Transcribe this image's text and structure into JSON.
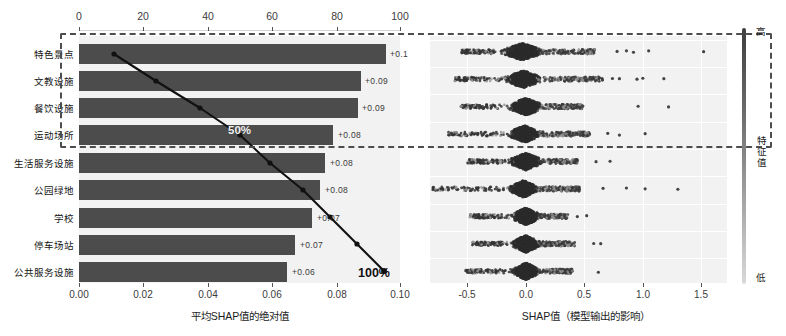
{
  "chart_data": {
    "type": "bar",
    "title": "",
    "subtitle": "",
    "panels": [
      {
        "name": "mean-abs-shap-bar",
        "type": "bar",
        "orientation": "horizontal",
        "categories": [
          "特色景点",
          "文教设施",
          "餐饮设施",
          "运动场所",
          "生活服务设施",
          "公园绿地",
          "学校",
          "停车场站",
          "公共服务设施"
        ],
        "values": [
          0.1,
          0.09,
          0.09,
          0.08,
          0.08,
          0.08,
          0.07,
          0.07,
          0.06
        ],
        "value_labels": [
          "+0.1",
          "+0.09",
          "+0.09",
          "+0.08",
          "+0.08",
          "+0.08",
          "+0.07",
          "+0.07",
          "+0.06"
        ],
        "xlabel": "平均SHAP值的绝对值",
        "ylabel": "",
        "xlim": [
          0.0,
          0.1005
        ],
        "xticks": [
          "0.00",
          "0.02",
          "0.04",
          "0.06",
          "0.08",
          "0.10"
        ],
        "xtick_values": [
          0.0,
          0.02,
          0.04,
          0.06,
          0.08,
          0.1
        ],
        "grid": false,
        "bar_color": "#4c4c4c",
        "plot_bg": "#f2f2f2"
      },
      {
        "name": "cumulative-pareto-line",
        "type": "line",
        "secondary_axis": "top",
        "xticks_top": [
          "0",
          "20",
          "40",
          "60",
          "80",
          "100"
        ],
        "xtick_top_values": [
          0,
          20,
          40,
          60,
          80,
          100
        ],
        "cumulative_percent": [
          11.0,
          24.0,
          37.5,
          50.0,
          60.5,
          71.0,
          80.5,
          89.5,
          100.0
        ],
        "annotations": [
          {
            "text": "50%",
            "at_category": "运动场所",
            "value": 50
          },
          {
            "text": "100%",
            "at_category": "公共服务设施",
            "value": 100
          }
        ],
        "line_color": "#101010",
        "marker": "circle"
      },
      {
        "name": "shap-beeswarm",
        "type": "scatter",
        "categories": [
          "特色景点",
          "文教设施",
          "餐饮设施",
          "运动场所",
          "生活服务设施",
          "公园绿地",
          "学校",
          "停车场站",
          "公共服务设施"
        ],
        "xlabel": "SHAP值（模型输出的影响）",
        "xlim": [
          -0.82,
          1.72
        ],
        "xticks": [
          "-0.5",
          "0.0",
          "0.5",
          "1.0",
          "1.5"
        ],
        "xtick_values": [
          -0.5,
          0.0,
          0.5,
          1.0,
          1.5
        ],
        "grid": true,
        "plot_bg": "#f2f2f2",
        "rows": [
          {
            "category": "特色景点",
            "center": -0.03,
            "core_w": 0.3,
            "tail_right": 0.62,
            "tail_left": -0.52,
            "outliers": [
              0.78,
              0.86,
              0.92,
              1.05,
              1.52
            ]
          },
          {
            "category": "文教设施",
            "center": -0.02,
            "core_w": 0.28,
            "tail_right": 0.68,
            "tail_left": -0.6,
            "outliers": [
              0.74,
              0.8,
              0.95,
              1.0,
              1.18
            ]
          },
          {
            "category": "餐饮设施",
            "center": 0.0,
            "core_w": 0.26,
            "tail_right": 0.5,
            "tail_left": -0.56,
            "outliers": [
              0.96,
              1.22
            ]
          },
          {
            "category": "运动场所",
            "center": -0.01,
            "core_w": 0.24,
            "tail_right": 0.56,
            "tail_left": -0.66,
            "outliers": [
              0.7,
              0.8,
              1.02
            ]
          },
          {
            "category": "生活服务设施",
            "center": 0.0,
            "core_w": 0.25,
            "tail_right": 0.44,
            "tail_left": -0.5,
            "outliers": [
              0.6,
              0.72
            ]
          },
          {
            "category": "公园绿地",
            "center": -0.02,
            "core_w": 0.22,
            "tail_right": 0.48,
            "tail_left": -0.78,
            "outliers": [
              0.66,
              0.86,
              1.02,
              1.3
            ]
          },
          {
            "category": "学校",
            "center": 0.0,
            "core_w": 0.22,
            "tail_right": 0.36,
            "tail_left": -0.48,
            "outliers": [
              0.44,
              0.52
            ]
          },
          {
            "category": "停车场站",
            "center": 0.0,
            "core_w": 0.22,
            "tail_right": 0.42,
            "tail_left": -0.46,
            "outliers": [
              0.58,
              0.64
            ]
          },
          {
            "category": "公共服务设施",
            "center": 0.0,
            "core_w": 0.21,
            "tail_right": 0.4,
            "tail_left": -0.52,
            "outliers": [
              0.62
            ]
          }
        ]
      }
    ],
    "colorbar": {
      "title": "特征值",
      "high_label": "高",
      "low_label": "低",
      "high_color": "#3f3f3f",
      "low_color": "#d9d9d9"
    },
    "highlight_box": {
      "label": "",
      "covers_categories": [
        "特色景点",
        "文教设施",
        "餐饮设施",
        "运动场所"
      ],
      "style": "dashed",
      "color": "#4d4d4d"
    }
  }
}
